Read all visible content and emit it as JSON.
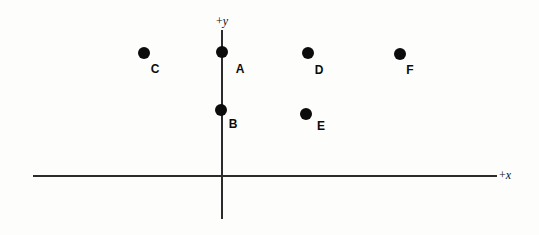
{
  "figure": {
    "background_color": "#fdfdfc",
    "ink_color": "#0c0c0c",
    "axis_color": "#2b2b2b"
  },
  "axes": {
    "x_label_sign": "+",
    "x_label_var": "x",
    "y_label_sign": "+",
    "y_label_var": "y"
  },
  "chart_data": {
    "type": "scatter",
    "title": "",
    "xlabel": "+x",
    "ylabel": "+y",
    "grid": false,
    "legend": "none",
    "axis_style": "cartesian-cross",
    "origin_px": [
      222,
      176
    ],
    "x_axis_px": [
      33,
      497
    ],
    "y_axis_px": [
      30,
      219
    ],
    "points": [
      {
        "label": "A",
        "px": [
          222,
          52
        ],
        "label_px": [
          240,
          69
        ]
      },
      {
        "label": "B",
        "px": [
          221,
          110
        ],
        "label_px": [
          233,
          124
        ]
      },
      {
        "label": "C",
        "px": [
          144,
          53
        ],
        "label_px": [
          155,
          69
        ]
      },
      {
        "label": "D",
        "px": [
          308,
          53
        ],
        "label_px": [
          319,
          70
        ]
      },
      {
        "label": "E",
        "px": [
          306,
          114
        ],
        "label_px": [
          321,
          126
        ]
      },
      {
        "label": "F",
        "px": [
          400,
          54
        ],
        "label_px": [
          410,
          70
        ]
      }
    ]
  }
}
